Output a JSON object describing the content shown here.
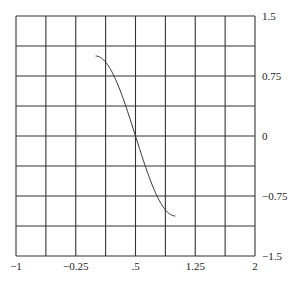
{
  "chart_data": {
    "type": "line",
    "title": "",
    "xlabel": "",
    "ylabel": "",
    "xlim": [
      -1,
      2
    ],
    "ylim": [
      -1.5,
      1.5
    ],
    "grid": true,
    "grid_divisions": {
      "x": 8,
      "y": 8
    },
    "x_tick_labels": [
      "-1",
      "-0.25",
      ".5",
      "1.25",
      "2"
    ],
    "x_tick_values": [
      -1,
      -0.25,
      0.5,
      1.25,
      2
    ],
    "y_tick_labels": [
      "1.5",
      "0.75",
      "0",
      "-0.75",
      "-1.5"
    ],
    "y_tick_values": [
      1.5,
      0.75,
      0,
      -0.75,
      -1.5
    ],
    "y_axis_position": "right",
    "series": [
      {
        "name": "curve",
        "function": "cos(pi*x)",
        "x": [
          0,
          0.1,
          0.2,
          0.3,
          0.4,
          0.5,
          0.6,
          0.7,
          0.8,
          0.9,
          1.0
        ],
        "y": [
          1.0,
          0.95,
          0.81,
          0.59,
          0.31,
          0.0,
          -0.31,
          -0.59,
          -0.81,
          -0.95,
          -1.0
        ]
      }
    ],
    "legend": null
  }
}
